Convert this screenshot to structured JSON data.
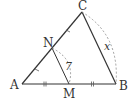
{
  "diagram": {
    "points": {
      "A": {
        "label": "A",
        "x": 22,
        "y": 84
      },
      "B": {
        "label": "B",
        "x": 116,
        "y": 84
      },
      "C": {
        "label": "C",
        "x": 82,
        "y": 12
      },
      "N": {
        "label": "N",
        "x": 52,
        "y": 48
      },
      "M": {
        "label": "M",
        "x": 69,
        "y": 84
      }
    },
    "measurements": {
      "NM": "7",
      "CB": "x"
    },
    "tick_marks": {
      "AM_MB": "double tick (equal)",
      "AN_NC": "single tick (equal)"
    },
    "colors": {
      "line": "#333333",
      "dashed": "#888888"
    }
  }
}
